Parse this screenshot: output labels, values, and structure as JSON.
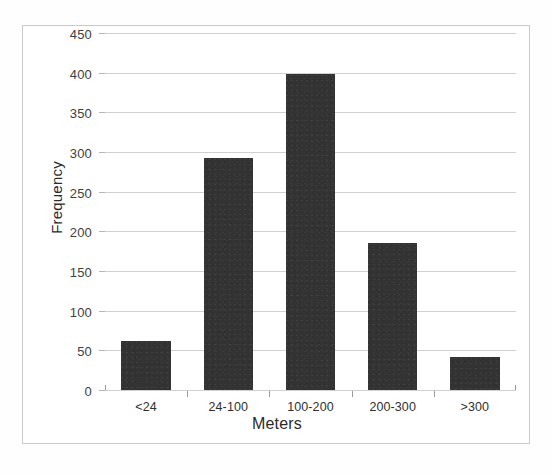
{
  "chart_data": {
    "type": "bar",
    "title": "",
    "subtitle": "",
    "categories": [
      "<24",
      "24-100",
      "100-200",
      "200-300",
      ">300"
    ],
    "values": [
      62,
      293,
      398,
      185,
      42
    ],
    "xlabel": "Meters",
    "ylabel": "Frequency",
    "ylim": [
      0,
      450
    ],
    "xlim": null,
    "y_ticks": [
      0,
      50,
      100,
      150,
      200,
      250,
      300,
      350,
      400,
      450
    ],
    "y_tick_labels": [
      "0",
      "50",
      "100",
      "150",
      "200",
      "250",
      "300",
      "350",
      "400",
      "450"
    ],
    "grid": "horizontal",
    "legend": null,
    "legend_position": "none",
    "annotations": [],
    "series": [
      {
        "name": "Frequency",
        "values": [
          62,
          293,
          398,
          185,
          42
        ],
        "color": "#333333"
      }
    ],
    "colors": {
      "bar_fill": "#333333",
      "gridline": "#d0d0d0",
      "axis_line": "#8a8a8a",
      "frame_border": "#c9c9c9",
      "plot_background": "#ffffff",
      "text": "#2b2b2b"
    }
  }
}
